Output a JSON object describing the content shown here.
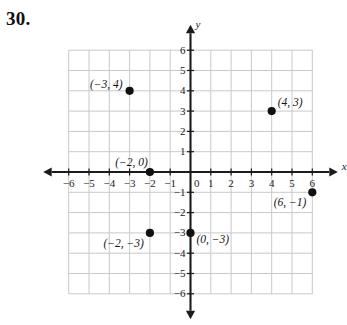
{
  "problem": {
    "number": "30."
  },
  "chart_data": {
    "type": "scatter",
    "title": "",
    "xlabel": "x",
    "ylabel": "y",
    "xlim": [
      -6,
      6
    ],
    "ylim": [
      -6,
      6
    ],
    "grid": true,
    "legend": null,
    "x_ticks": [
      -6,
      -5,
      -4,
      -3,
      -2,
      -1,
      0,
      1,
      2,
      3,
      4,
      5,
      6
    ],
    "y_ticks": [
      -6,
      -5,
      -4,
      -3,
      -2,
      -1,
      1,
      2,
      3,
      4,
      5,
      6
    ],
    "x_tick_labels": [
      "-6",
      "-5",
      "-4",
      "-3",
      "-2",
      "-1",
      "0",
      "1",
      "2",
      "3",
      "4",
      "5",
      "6"
    ],
    "y_tick_labels": [
      "-6",
      "-5",
      "-4",
      "-3",
      "-2",
      "-1",
      "1",
      "2",
      "3",
      "4",
      "5",
      "6"
    ],
    "points": [
      {
        "x": -3,
        "y": 4,
        "label": "(−3, 4)",
        "label_pos": "left"
      },
      {
        "x": 4,
        "y": 3,
        "label": "(4, 3)",
        "label_pos": "upper-right"
      },
      {
        "x": -2,
        "y": 0,
        "label": "(−2, 0)",
        "label_pos": "upper-left"
      },
      {
        "x": 6,
        "y": -1,
        "label": "(6, −1)",
        "label_pos": "lower-left"
      },
      {
        "x": -2,
        "y": -3,
        "label": "(−2, −3)",
        "label_pos": "lower-left"
      },
      {
        "x": 0,
        "y": -3,
        "label": "(0, −3)",
        "label_pos": "right"
      }
    ]
  },
  "colors": {
    "grid_line": "#c9c9c9",
    "axis_line": "#1b1b1b",
    "point_fill": "#111111",
    "text": "#1b1b1b",
    "background": "#ffffff"
  }
}
